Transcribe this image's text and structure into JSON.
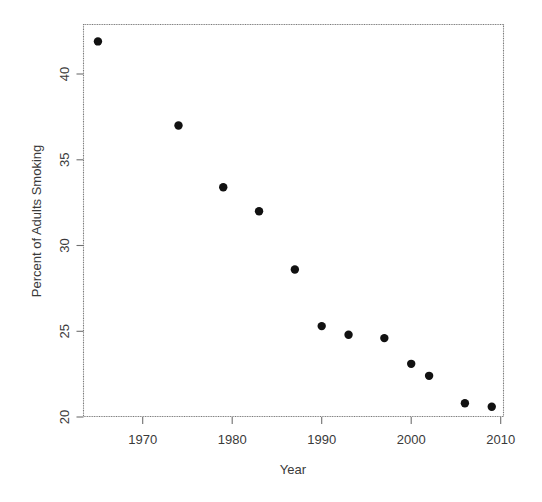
{
  "chart_data": {
    "type": "scatter",
    "title": "",
    "xlabel": "Year",
    "ylabel": "Percent of Adults Smoking",
    "x": [
      1965,
      1974,
      1979,
      1983,
      1987,
      1990,
      1993,
      1997,
      2000,
      2002,
      2006,
      2009
    ],
    "values": [
      41.9,
      37.0,
      33.4,
      32.0,
      28.6,
      25.3,
      24.8,
      24.6,
      23.1,
      22.4,
      20.8,
      20.6
    ],
    "series": [
      {
        "name": "Percent of Adults Smoking",
        "points": [
          {
            "x": 1965,
            "y": 41.9
          },
          {
            "x": 1974,
            "y": 37.0
          },
          {
            "x": 1979,
            "y": 33.4
          },
          {
            "x": 1983,
            "y": 32.0
          },
          {
            "x": 1987,
            "y": 28.6
          },
          {
            "x": 1990,
            "y": 25.3
          },
          {
            "x": 1993,
            "y": 24.8
          },
          {
            "x": 1997,
            "y": 24.6
          },
          {
            "x": 2000,
            "y": 23.1
          },
          {
            "x": 2002,
            "y": 22.4
          },
          {
            "x": 2006,
            "y": 20.8
          },
          {
            "x": 2009,
            "y": 20.6
          }
        ]
      }
    ],
    "xlim": [
      1963.5,
      2010.5
    ],
    "ylim": [
      19.8,
      42.6
    ],
    "xticks": [
      1970,
      1980,
      1990,
      2000,
      2010
    ],
    "xticklabels": [
      "1970",
      "1980",
      "1990",
      "2000",
      "2010"
    ],
    "yticks": [
      20,
      25,
      30,
      35,
      40
    ],
    "yticklabels": [
      "20",
      "25",
      "30",
      "35",
      "40"
    ],
    "grid": false,
    "legend": null,
    "marker": "filled-circle",
    "marker_color": "#111111",
    "frame_color": "#7a7a7a",
    "text_color": "#3a3a3a"
  },
  "axes": {
    "x_title": "Year",
    "y_title": "Percent of Adults Smoking",
    "x_tick_labels": [
      "1970",
      "1980",
      "1990",
      "2000",
      "2010"
    ],
    "y_tick_labels": [
      "20",
      "25",
      "30",
      "35",
      "40"
    ]
  }
}
